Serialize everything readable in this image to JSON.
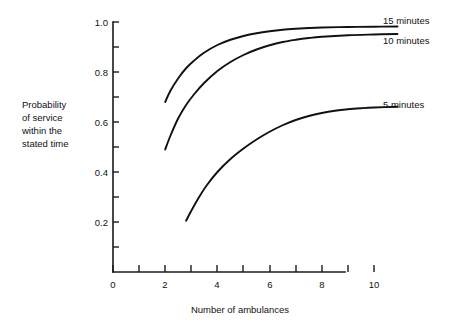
{
  "chart_data": {
    "type": "line",
    "title": "",
    "subtitle": "",
    "xlabel": "Number of ambulances",
    "ylabel_lines": [
      "Probability",
      "of service",
      "within the",
      "stated time"
    ],
    "ylabel": "Probability of service within the stated time",
    "xlim": [
      0,
      11
    ],
    "ylim": [
      0,
      1.0
    ],
    "grid": false,
    "legend_position": "right-inline-labels",
    "x_ticks": [
      0,
      1,
      2,
      3,
      4,
      5,
      6,
      7,
      8,
      9,
      10
    ],
    "x_tick_labels": [
      "0",
      "",
      "2",
      "",
      "4",
      "",
      "6",
      "",
      "8",
      "",
      "10"
    ],
    "y_ticks": [
      0.1,
      0.2,
      0.3,
      0.4,
      0.5,
      0.6,
      0.7,
      0.8,
      0.9,
      1.0
    ],
    "y_tick_labels": [
      "",
      "0.2",
      "",
      "0.4",
      "",
      "0.6",
      "",
      "0.8",
      "",
      "1.0"
    ],
    "series": [
      {
        "name": "15 minutes",
        "label": "15 minutes",
        "color": "#111111",
        "x": [
          2.0,
          2.2,
          2.5,
          2.8,
          3.1,
          3.5,
          4.0,
          4.5,
          5.0,
          5.5,
          6.0,
          6.5,
          7.0,
          7.5,
          8.0,
          9.0,
          10.0,
          10.9
        ],
        "values": [
          0.68,
          0.725,
          0.775,
          0.815,
          0.845,
          0.878,
          0.908,
          0.929,
          0.944,
          0.955,
          0.963,
          0.969,
          0.973,
          0.976,
          0.978,
          0.98,
          0.981,
          0.982
        ]
      },
      {
        "name": "10 minutes",
        "label": "10 minutes",
        "color": "#111111",
        "x": [
          2.0,
          2.2,
          2.5,
          2.8,
          3.1,
          3.5,
          4.0,
          4.5,
          5.0,
          5.5,
          6.0,
          6.5,
          7.0,
          7.5,
          8.0,
          9.0,
          10.0,
          10.9
        ],
        "values": [
          0.49,
          0.545,
          0.615,
          0.668,
          0.71,
          0.757,
          0.804,
          0.84,
          0.868,
          0.89,
          0.907,
          0.92,
          0.929,
          0.936,
          0.941,
          0.947,
          0.95,
          0.952
        ]
      },
      {
        "name": "5 minutes",
        "label": "5 minutes",
        "color": "#111111",
        "x": [
          2.8,
          3.0,
          3.3,
          3.6,
          4.0,
          4.5,
          5.0,
          5.5,
          6.0,
          6.5,
          7.0,
          7.5,
          8.0,
          8.5,
          9.0,
          9.5,
          10.0,
          10.9
        ],
        "values": [
          0.205,
          0.245,
          0.3,
          0.348,
          0.4,
          0.452,
          0.494,
          0.53,
          0.561,
          0.587,
          0.608,
          0.624,
          0.636,
          0.645,
          0.651,
          0.655,
          0.658,
          0.661
        ]
      }
    ]
  },
  "axes": {
    "x_title": "Number of ambulances",
    "y_title_lines": [
      "Probability",
      "of service",
      "within the",
      "stated time"
    ]
  },
  "colors": {
    "ink": "#111111",
    "axis": "#1a1a1a",
    "background": "#ffffff"
  }
}
